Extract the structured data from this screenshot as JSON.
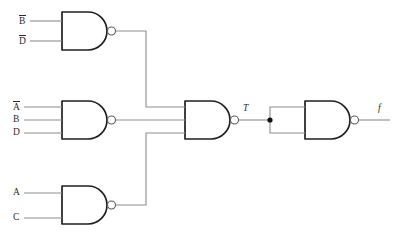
{
  "diagram": {
    "canvas": {
      "width": 398,
      "height": 241,
      "background": "#ffffff"
    },
    "colors": {
      "gate_outline": "#231f20",
      "wire": "#8d8d8d",
      "bubble_stroke": "#5a5a5a",
      "bubble_fill": "#ffffff",
      "junction": "#111111",
      "text": "#2b2b2b"
    },
    "inputs": [
      {
        "id": "in-b-bar",
        "base": "B",
        "overbar": true,
        "display": "B̅",
        "gate": "nand-1",
        "pin": 1
      },
      {
        "id": "in-d-bar",
        "base": "D",
        "overbar": true,
        "display": "D̅",
        "gate": "nand-1",
        "pin": 2
      },
      {
        "id": "in-a-bar",
        "base": "A",
        "overbar": true,
        "display": "A̅",
        "gate": "nand-2",
        "pin": 1
      },
      {
        "id": "in-b",
        "base": "B",
        "overbar": false,
        "display": "B",
        "gate": "nand-2",
        "pin": 2
      },
      {
        "id": "in-d",
        "base": "D",
        "overbar": false,
        "display": "D",
        "gate": "nand-2",
        "pin": 3
      },
      {
        "id": "in-a",
        "base": "A",
        "overbar": false,
        "display": "A",
        "gate": "nand-3",
        "pin": 1
      },
      {
        "id": "in-c",
        "base": "C",
        "overbar": false,
        "display": "C",
        "gate": "nand-3",
        "pin": 2
      }
    ],
    "gates": [
      {
        "id": "nand-1",
        "type": "NAND",
        "inputs_count": 2,
        "input_labels": [
          "B̅",
          "D̅"
        ],
        "output": "n1"
      },
      {
        "id": "nand-2",
        "type": "NAND",
        "inputs_count": 3,
        "input_labels": [
          "A̅",
          "B",
          "D"
        ],
        "output": "n2"
      },
      {
        "id": "nand-3",
        "type": "NAND",
        "inputs_count": 2,
        "input_labels": [
          "A",
          "C"
        ],
        "output": "n3"
      },
      {
        "id": "nand-4",
        "type": "NAND",
        "inputs_count": 3,
        "input_labels": [
          "n1",
          "n2",
          "n3"
        ],
        "output": "T"
      },
      {
        "id": "nand-5",
        "type": "NAND",
        "inputs_count": 2,
        "input_labels": [
          "T",
          "T"
        ],
        "output": "f"
      }
    ],
    "nodes": [
      {
        "id": "node-t",
        "label": "T",
        "italic": true,
        "junction": true
      },
      {
        "id": "node-f",
        "label": "f",
        "italic": true,
        "junction": false
      }
    ],
    "node_labels": {
      "intermediate": "T",
      "output": "f"
    }
  }
}
